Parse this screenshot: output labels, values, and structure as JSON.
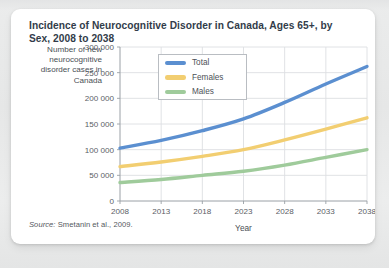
{
  "card": {
    "title": "Incidence of Neurocognitive Disorder in Canada, Ages 65+, by Sex, 2008 to 2038",
    "source_label": "Source:",
    "source_text": "Smetanin et al., 2009."
  },
  "chart_data": {
    "type": "line",
    "title": "Incidence of Neurocognitive Disorder in Canada, Ages 65+, by Sex, 2008 to 2038",
    "xlabel": "Year",
    "ylabel": "Number of new neurocognitive disorder cases in Canada",
    "x": [
      2008,
      2013,
      2018,
      2023,
      2028,
      2033,
      2038
    ],
    "xtick_labels": [
      "2008",
      "2013",
      "2018",
      "2023",
      "2028",
      "2033",
      "2038"
    ],
    "ytick_values": [
      0,
      50000,
      100000,
      150000,
      200000,
      250000,
      300000
    ],
    "ytick_labels": [
      "0",
      "50 000",
      "100 000",
      "150 000",
      "200 000",
      "250 000",
      "300 000"
    ],
    "xlim": [
      2008,
      2038
    ],
    "ylim": [
      0,
      300000
    ],
    "grid": true,
    "legend_position": "top-left-inside",
    "series": [
      {
        "name": "Total",
        "color": "#5b8fd0",
        "values": [
          103000,
          118000,
          137000,
          160000,
          192000,
          228000,
          262000
        ]
      },
      {
        "name": "Females",
        "color": "#f2ce71",
        "values": [
          67000,
          76000,
          87000,
          100000,
          119000,
          140000,
          162000
        ]
      },
      {
        "name": "Males",
        "color": "#9fcb9b",
        "values": [
          36000,
          42000,
          50000,
          58000,
          70000,
          85000,
          100000
        ]
      }
    ]
  }
}
